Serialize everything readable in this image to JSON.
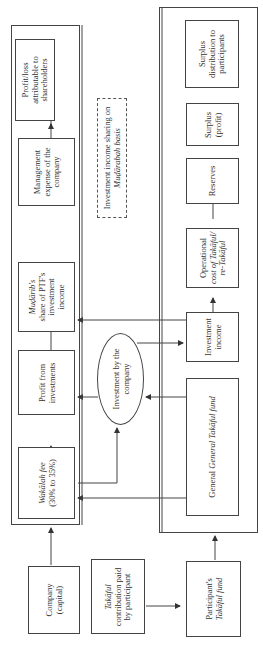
{
  "diagram": {
    "orientation": "rotated 90 degrees counter-clockwise",
    "company_side": {
      "boxes": [
        {
          "id": "wakalah-fee",
          "line1": "Wakālah fee",
          "line2": "(30% to 35%)"
        },
        {
          "id": "profit-from-investments",
          "line1": "Profit from",
          "line2": "investments"
        },
        {
          "id": "mudarib-share",
          "line1": "Muḍārib's",
          "line2": "share of PTF's",
          "line3": "investment",
          "line4": "income"
        },
        {
          "id": "management-expense",
          "line1": "Management",
          "line2": "expense of the",
          "line3": "company"
        },
        {
          "id": "profit-loss-shareholders",
          "line1": "Profit/loss",
          "line2": "attributable to",
          "line3": "shareholders"
        }
      ]
    },
    "participant_side": {
      "boxes": [
        {
          "id": "general-takaful-fund",
          "line1": "General Takāful fund"
        },
        {
          "id": "investment-income",
          "line1": "Investment",
          "line2": "income"
        },
        {
          "id": "operational-cost",
          "line1": "Operational",
          "line2": "cost of Takāful/",
          "line3": "re-Takāful"
        },
        {
          "id": "reserves",
          "line1": "Reserves"
        },
        {
          "id": "surplus-profit",
          "line1": "Surplus",
          "line2": "(profit)"
        },
        {
          "id": "surplus-distribution",
          "line1": "Surplus",
          "line2": "distribution to",
          "line3": "participants"
        }
      ]
    },
    "center": {
      "ellipse": {
        "line1": "Investment by the",
        "line2": "company"
      },
      "note": {
        "line1": "Investment income sharing on",
        "line2": "Muḍārabah basis"
      }
    },
    "bottom": {
      "company_capital": {
        "line1": "Company",
        "line2": "(capital)"
      },
      "contribution": {
        "line1": "Takāful",
        "line2": "contribution paid",
        "line3": "by participant"
      },
      "participant_fund": {
        "line1": "Participant's",
        "line2": "Takāful fund"
      }
    }
  }
}
